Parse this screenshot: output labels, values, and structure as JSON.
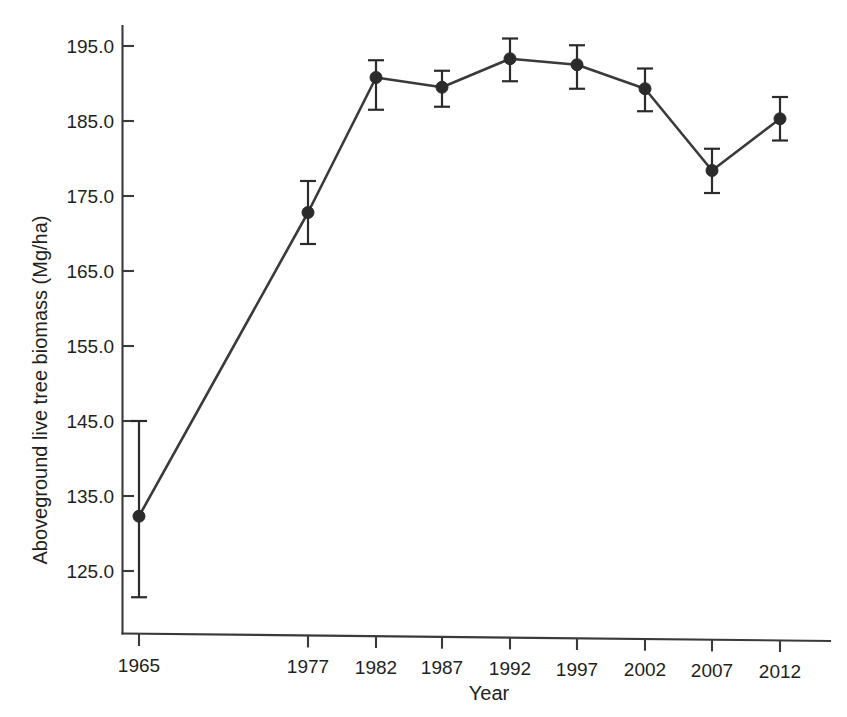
{
  "chart_data": {
    "type": "line",
    "title": "",
    "subtitle": "",
    "xlabel": "Year",
    "ylabel": "Aboveground live tree biomass (Mg/ha)",
    "categories": [
      "1965",
      "1977",
      "1982",
      "1987",
      "1992",
      "1997",
      "2002",
      "2007",
      "2012"
    ],
    "values": [
      132.3,
      172.8,
      190.8,
      189.5,
      193.3,
      192.5,
      189.3,
      178.4,
      185.3
    ],
    "error_low": [
      121.5,
      168.6,
      186.5,
      186.9,
      190.3,
      189.3,
      186.3,
      175.4,
      182.4
    ],
    "error_high": [
      145.0,
      177.0,
      193.1,
      191.7,
      196.0,
      195.1,
      192.0,
      181.3,
      188.2
    ],
    "series": [
      {
        "name": "Aboveground live tree biomass",
        "values": [
          132.3,
          172.8,
          190.8,
          189.5,
          193.3,
          192.5,
          189.3,
          178.4,
          185.3
        ]
      }
    ],
    "ytick_labels": [
      "125.0",
      "135.0",
      "145.0",
      "155.0",
      "165.0",
      "175.0",
      "185.0",
      "195.0"
    ],
    "ytick_values": [
      125.0,
      135.0,
      145.0,
      155.0,
      165.0,
      175.0,
      185.0,
      195.0
    ],
    "ylim": [
      117.0,
      199.0
    ],
    "grid": false,
    "legend": false,
    "legend_position": "none",
    "marker": "filled-circle",
    "line_color": "#3a3a3a",
    "marker_color": "#2b2b2b",
    "error_bar_style": "capped-vertical",
    "x_axis_spacing": "categorical-uneven",
    "xtick_pixel_positions": [
      139,
      308,
      376,
      442,
      510,
      577,
      645,
      712,
      780
    ],
    "background_color": "#ffffff"
  }
}
